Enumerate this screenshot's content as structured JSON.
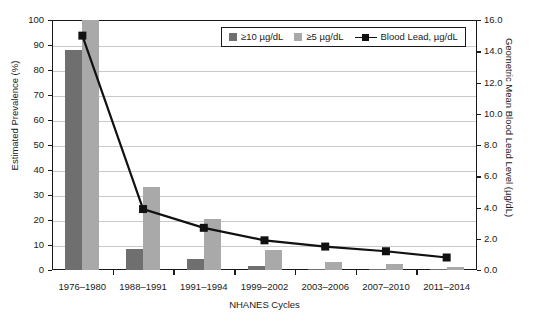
{
  "chart_data": {
    "type": "bar",
    "title": "",
    "xlabel": "NHANES Cycles",
    "ylabel": "Estimated Prevalence (%)",
    "ylabel_right": "Geometric Mean Blood Lead Level (µg/dL)",
    "categories": [
      "1976–1980",
      "1988–1991",
      "1991–1994",
      "1999–2002",
      "2003–2006",
      "2007–2010",
      "2011–2014"
    ],
    "ylim": [
      0,
      100
    ],
    "ylim_right": [
      0,
      16
    ],
    "yticks": [
      "0",
      "10",
      "20",
      "30",
      "40",
      "50",
      "60",
      "70",
      "80",
      "90",
      "100"
    ],
    "yticks_right": [
      "0.0",
      "2.0",
      "4.0",
      "6.0",
      "8.0",
      "10.0",
      "12.0",
      "14.0",
      "16.0"
    ],
    "grid": true,
    "legend_position": "top-center",
    "series": [
      {
        "name": "≥10 µg/dL",
        "type": "bar",
        "axis": "left",
        "color": "#706f6f",
        "values": [
          88.0,
          8.6,
          4.4,
          1.6,
          0.6,
          0.2,
          0.1
        ]
      },
      {
        "name": "≥5 µg/dL",
        "type": "bar",
        "axis": "left",
        "color": "#a9a9a9",
        "values": [
          100.0,
          33.2,
          20.6,
          8.1,
          3.2,
          2.6,
          1.3
        ]
      },
      {
        "name": "Blood Lead, µg/dL",
        "type": "line",
        "axis": "right",
        "color": "#111111",
        "values": [
          15.0,
          3.9,
          2.7,
          1.9,
          1.5,
          1.2,
          0.8
        ]
      }
    ]
  },
  "legend": {
    "items": [
      {
        "label": "≥10 µg/dL",
        "marker": "square-swatch-dark"
      },
      {
        "label": "≥5 µg/dL",
        "marker": "square-swatch-light"
      },
      {
        "label": "Blood Lead, µg/dL",
        "marker": "line-square-marker"
      }
    ]
  }
}
